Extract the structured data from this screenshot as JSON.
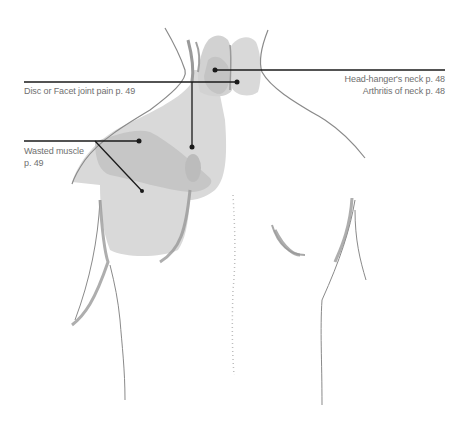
{
  "diagram": {
    "colors": {
      "background": "#ffffff",
      "body_outline": "#8a8a8a",
      "zone_light": "#d9d9d9",
      "zone_mid": "#c6c6c6",
      "zone_dark": "#b8b8b8",
      "leader_line": "#1a1a1a",
      "label_text": "#6f6f6f"
    },
    "callouts": [
      {
        "id": "head-hanger",
        "label": "Head-hanger's neck p. 48",
        "align": "right"
      },
      {
        "id": "arthritis-neck",
        "label": "Arthritis of neck p. 48",
        "align": "right"
      },
      {
        "id": "disc-facet",
        "label": "Disc or Facet joint pain p. 49",
        "align": "left"
      },
      {
        "id": "wasted-muscle-line1",
        "label": "Wasted muscle",
        "align": "left"
      },
      {
        "id": "wasted-muscle-line2",
        "label": "p. 49",
        "align": "left"
      }
    ]
  }
}
